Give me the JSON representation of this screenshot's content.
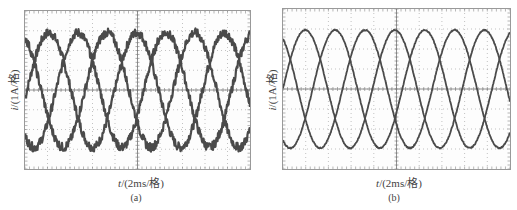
{
  "chart_data": [
    {
      "type": "line",
      "panel": "(a)",
      "title": "",
      "caption": "(a)",
      "xlabel": "t/(2ms/格)",
      "ylabel": "i/(1A/格)",
      "x_divisions": 10,
      "y_divisions": 8,
      "x_unit_per_div": "2ms",
      "y_unit_per_div": "1A",
      "grid": true,
      "grid_style": "dotted",
      "noise": "high-frequency ripple visible",
      "xlim": [
        0,
        20
      ],
      "ylim": [
        -4,
        4
      ],
      "period_ms": 7.8,
      "series": [
        {
          "name": "phase A",
          "amplitude": 2.9,
          "peak_time_ms": 2.13,
          "peaks_ms": [
            2.13,
            9.93,
            17.73
          ]
        },
        {
          "name": "phase B",
          "amplitude": 2.9,
          "peak_time_ms": 4.71,
          "peaks_ms": [
            4.71,
            12.51
          ]
        },
        {
          "name": "phase C",
          "amplitude": 2.9,
          "peak_time_ms": 7.29,
          "peaks_ms": [
            7.29,
            15.09
          ]
        }
      ]
    },
    {
      "type": "line",
      "panel": "(b)",
      "title": "",
      "caption": "(b)",
      "xlabel": "t/(2ms/格)",
      "ylabel": "i/(1A/格)",
      "x_divisions": 10,
      "y_divisions": 8,
      "x_unit_per_div": "2ms",
      "y_unit_per_div": "1A",
      "grid": true,
      "grid_style": "dotted",
      "noise": "low ripple, smooth",
      "xlim": [
        0,
        20
      ],
      "ylim": [
        -4,
        4
      ],
      "period_ms": 7.9,
      "series": [
        {
          "name": "phase A",
          "amplitude": 2.95,
          "peak_time_ms": 1.96,
          "peaks_ms": [
            1.96,
            9.86,
            17.76
          ]
        },
        {
          "name": "phase B",
          "amplitude": 2.95,
          "peak_time_ms": 4.59,
          "peaks_ms": [
            4.59,
            12.49
          ]
        },
        {
          "name": "phase C",
          "amplitude": 2.95,
          "peak_time_ms": 7.22,
          "peaks_ms": [
            7.22,
            15.12
          ]
        }
      ]
    }
  ],
  "colors": {
    "trace": "#4a4a4a",
    "grid": "#9a9a9a",
    "frame": "#999999",
    "text": "#444444"
  },
  "labels": {
    "a": {
      "y_italic": "i",
      "y_rest": "/(1A/格)",
      "x_italic": "t",
      "x_rest": "/(2ms/格)",
      "caption": "(a)"
    },
    "b": {
      "y_italic": "i",
      "y_rest": "/(1A/格)",
      "x_italic": "t",
      "x_rest": "/(2ms/格)",
      "caption": "(b)"
    }
  }
}
